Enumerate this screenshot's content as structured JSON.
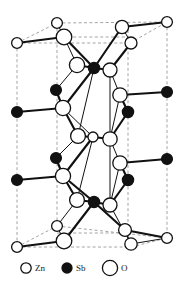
{
  "figure": {
    "kind": "crystal-structure-unit-cell",
    "width": 184,
    "height": 288,
    "background": "#ffffff"
  },
  "legend": {
    "items": [
      {
        "symbol": "Zn",
        "marker": "small-open-circle",
        "radius": 5.2,
        "fill": "#ffffff",
        "stroke": "#111111",
        "cx": 26,
        "cy": 268
      },
      {
        "symbol": "Sb",
        "marker": "small-filled-circle",
        "radius": 5.0,
        "fill": "#111111",
        "stroke": "#111111",
        "cx": 67,
        "cy": 268
      },
      {
        "symbol": "O",
        "marker": "large-open-circle",
        "radius": 7.6,
        "fill": "#ffffff",
        "stroke": "#111111",
        "cx": 110,
        "cy": 268
      }
    ],
    "label_positions": [
      {
        "text": "Zn",
        "x": 35,
        "y": 271
      },
      {
        "text": "Sb",
        "x": 76,
        "y": 271
      },
      {
        "text": "O",
        "x": 121,
        "y": 271
      }
    ]
  },
  "style": {
    "bond_color": "#111111",
    "bond_width": 2.1,
    "thin_bond_width": 1.0,
    "cell_edge_color": "#9a9a9a",
    "cell_edge_width": 0.9,
    "cell_dash": "3,2.4",
    "atom_stroke": "#111111",
    "atom_stroke_width": 1.3,
    "open_fill": "#ffffff",
    "filled_fill": "#111111"
  },
  "unit_cell": {
    "note": "dashed grey parallelepiped outline",
    "lines": [
      {
        "name": "left-front-vertical",
        "x1": 17,
        "y1": 43,
        "x2": 17,
        "y2": 247
      },
      {
        "name": "mid-left-vertical",
        "x1": 57,
        "y1": 23,
        "x2": 57,
        "y2": 226
      },
      {
        "name": "mid-right-vertical",
        "x1": 128,
        "y1": 30,
        "x2": 128,
        "y2": 243
      },
      {
        "name": "right-back-vertical",
        "x1": 167,
        "y1": 22,
        "x2": 167,
        "y2": 238
      },
      {
        "name": "top-front-horizontal",
        "x1": 17,
        "y1": 43,
        "x2": 130,
        "y2": 43
      },
      {
        "name": "top-back-horizontal",
        "x1": 57,
        "y1": 23,
        "x2": 167,
        "y2": 22
      },
      {
        "name": "bot-front-horizontal",
        "x1": 17,
        "y1": 247,
        "x2": 131,
        "y2": 247
      },
      {
        "name": "bot-back-horizontal",
        "x1": 57,
        "y1": 226,
        "x2": 167,
        "y2": 238
      },
      {
        "name": "top-left-diagonal",
        "x1": 17,
        "y1": 43,
        "x2": 57,
        "y2": 23
      },
      {
        "name": "top-right-diagonal",
        "x1": 130,
        "y1": 43,
        "x2": 167,
        "y2": 22
      },
      {
        "name": "bot-left-diagonal",
        "x1": 17,
        "y1": 247,
        "x2": 57,
        "y2": 226
      },
      {
        "name": "bot-right-diagonal",
        "x1": 131,
        "y1": 247,
        "x2": 167,
        "y2": 238
      },
      {
        "name": "top-inner-horizontal",
        "x1": 57,
        "y1": 37,
        "x2": 128,
        "y2": 37
      },
      {
        "name": "bot-inner-horizontal",
        "x1": 57,
        "y1": 233,
        "x2": 128,
        "y2": 233
      }
    ]
  },
  "atoms": [
    {
      "id": "a01",
      "element": "Zn",
      "cx": 57,
      "cy": 23,
      "r": 5.4,
      "type": "open"
    },
    {
      "id": "a02",
      "element": "O",
      "cx": 64,
      "cy": 37,
      "r": 7.8,
      "type": "open"
    },
    {
      "id": "a03",
      "element": "Zn",
      "cx": 17,
      "cy": 43,
      "r": 5.4,
      "type": "open"
    },
    {
      "id": "a04",
      "element": "Zn",
      "cx": 122,
      "cy": 27,
      "r": 6.6,
      "type": "open"
    },
    {
      "id": "a05",
      "element": "Zn",
      "cx": 167,
      "cy": 22,
      "r": 5.4,
      "type": "open"
    },
    {
      "id": "a06",
      "element": "O",
      "cx": 131,
      "cy": 43,
      "r": 6.0,
      "type": "open"
    },
    {
      "id": "a07",
      "element": "O",
      "cx": 77,
      "cy": 65,
      "r": 7.6,
      "type": "open"
    },
    {
      "id": "a08",
      "element": "Sb",
      "cx": 94,
      "cy": 68,
      "r": 5.6,
      "type": "filled"
    },
    {
      "id": "a09",
      "element": "O",
      "cx": 110,
      "cy": 70,
      "r": 7.0,
      "type": "open"
    },
    {
      "id": "a10",
      "element": "Sb",
      "cx": 56,
      "cy": 90,
      "r": 5.4,
      "type": "filled"
    },
    {
      "id": "a11",
      "element": "O",
      "cx": 120,
      "cy": 95,
      "r": 7.2,
      "type": "open"
    },
    {
      "id": "a12",
      "element": "Sb",
      "cx": 167,
      "cy": 92,
      "r": 5.4,
      "type": "filled"
    },
    {
      "id": "a13",
      "element": "O",
      "cx": 63,
      "cy": 108,
      "r": 7.6,
      "type": "open"
    },
    {
      "id": "a14",
      "element": "Sb",
      "cx": 17,
      "cy": 112,
      "r": 5.4,
      "type": "filled"
    },
    {
      "id": "a15",
      "element": "Sb",
      "cx": 128,
      "cy": 112,
      "r": 5.6,
      "type": "filled"
    },
    {
      "id": "a16",
      "element": "O",
      "cx": 78,
      "cy": 136,
      "r": 7.4,
      "type": "open"
    },
    {
      "id": "a17",
      "element": "Zn",
      "cx": 93,
      "cy": 137,
      "r": 5.0,
      "type": "open"
    },
    {
      "id": "a18",
      "element": "O",
      "cx": 110,
      "cy": 139,
      "r": 7.2,
      "type": "open"
    },
    {
      "id": "a19",
      "element": "Sb",
      "cx": 56,
      "cy": 158,
      "r": 5.4,
      "type": "filled"
    },
    {
      "id": "a20",
      "element": "O",
      "cx": 120,
      "cy": 163,
      "r": 7.2,
      "type": "open"
    },
    {
      "id": "a21",
      "element": "Sb",
      "cx": 167,
      "cy": 159,
      "r": 5.4,
      "type": "filled"
    },
    {
      "id": "a22",
      "element": "O",
      "cx": 63,
      "cy": 176,
      "r": 7.6,
      "type": "open"
    },
    {
      "id": "a23",
      "element": "Sb",
      "cx": 17,
      "cy": 180,
      "r": 5.4,
      "type": "filled"
    },
    {
      "id": "a24",
      "element": "Sb",
      "cx": 128,
      "cy": 180,
      "r": 5.6,
      "type": "filled"
    },
    {
      "id": "a25",
      "element": "O",
      "cx": 77,
      "cy": 200,
      "r": 7.4,
      "type": "open"
    },
    {
      "id": "a26",
      "element": "Sb",
      "cx": 94,
      "cy": 202,
      "r": 5.6,
      "type": "filled"
    },
    {
      "id": "a27",
      "element": "O",
      "cx": 110,
      "cy": 205,
      "r": 7.0,
      "type": "open"
    },
    {
      "id": "a28",
      "element": "Zn",
      "cx": 57,
      "cy": 226,
      "r": 5.4,
      "type": "open"
    },
    {
      "id": "a29",
      "element": "Zn",
      "cx": 125,
      "cy": 230,
      "r": 6.4,
      "type": "open"
    },
    {
      "id": "a30",
      "element": "O",
      "cx": 64,
      "cy": 241,
      "r": 7.8,
      "type": "open"
    },
    {
      "id": "a31",
      "element": "O",
      "cx": 131,
      "cy": 244,
      "r": 6.2,
      "type": "open"
    },
    {
      "id": "a32",
      "element": "Zn",
      "cx": 17,
      "cy": 247,
      "r": 5.4,
      "type": "open"
    },
    {
      "id": "a33",
      "element": "Zn",
      "cx": 167,
      "cy": 238,
      "r": 5.4,
      "type": "open"
    }
  ],
  "bonds": [
    {
      "from": "a03",
      "to": "a02",
      "weight": "thick"
    },
    {
      "from": "a01",
      "to": "a02",
      "weight": "thin"
    },
    {
      "from": "a02",
      "to": "a08",
      "weight": "thick"
    },
    {
      "from": "a02",
      "to": "a07",
      "weight": "thin"
    },
    {
      "from": "a04",
      "to": "a05",
      "weight": "thick"
    },
    {
      "from": "a04",
      "to": "a08",
      "weight": "thick"
    },
    {
      "from": "a04",
      "to": "a06",
      "weight": "thin"
    },
    {
      "from": "a06",
      "to": "a09",
      "weight": "thick"
    },
    {
      "from": "a07",
      "to": "a08",
      "weight": "thick"
    },
    {
      "from": "a08",
      "to": "a09",
      "weight": "thick"
    },
    {
      "from": "a07",
      "to": "a10",
      "weight": "thin"
    },
    {
      "from": "a08",
      "to": "a13",
      "weight": "thick"
    },
    {
      "from": "a09",
      "to": "a11",
      "weight": "thin"
    },
    {
      "from": "a08",
      "to": "a16",
      "weight": "thin"
    },
    {
      "from": "a09",
      "to": "a18",
      "weight": "thin"
    },
    {
      "from": "a10",
      "to": "a13",
      "weight": "thick"
    },
    {
      "from": "a14",
      "to": "a13",
      "weight": "thick"
    },
    {
      "from": "a11",
      "to": "a15",
      "weight": "thick"
    },
    {
      "from": "a12",
      "to": "a11",
      "weight": "thick"
    },
    {
      "from": "a13",
      "to": "a16",
      "weight": "thick"
    },
    {
      "from": "a13",
      "to": "a17",
      "weight": "thin"
    },
    {
      "from": "a15",
      "to": "a18",
      "weight": "thick"
    },
    {
      "from": "a11",
      "to": "a18",
      "weight": "thin"
    },
    {
      "from": "a16",
      "to": "a17",
      "weight": "thick"
    },
    {
      "from": "a17",
      "to": "a18",
      "weight": "thick"
    },
    {
      "from": "a16",
      "to": "a19",
      "weight": "thin"
    },
    {
      "from": "a17",
      "to": "a22",
      "weight": "thick"
    },
    {
      "from": "a18",
      "to": "a20",
      "weight": "thin"
    },
    {
      "from": "a17",
      "to": "a25",
      "weight": "thin"
    },
    {
      "from": "a18",
      "to": "a27",
      "weight": "thin"
    },
    {
      "from": "a19",
      "to": "a22",
      "weight": "thick"
    },
    {
      "from": "a23",
      "to": "a22",
      "weight": "thick"
    },
    {
      "from": "a20",
      "to": "a24",
      "weight": "thick"
    },
    {
      "from": "a21",
      "to": "a20",
      "weight": "thick"
    },
    {
      "from": "a22",
      "to": "a25",
      "weight": "thick"
    },
    {
      "from": "a22",
      "to": "a26",
      "weight": "thick"
    },
    {
      "from": "a24",
      "to": "a27",
      "weight": "thick"
    },
    {
      "from": "a20",
      "to": "a27",
      "weight": "thin"
    },
    {
      "from": "a25",
      "to": "a26",
      "weight": "thick"
    },
    {
      "from": "a26",
      "to": "a27",
      "weight": "thick"
    },
    {
      "from": "a26",
      "to": "a30",
      "weight": "thick"
    },
    {
      "from": "a25",
      "to": "a28",
      "weight": "thin"
    },
    {
      "from": "a26",
      "to": "a29",
      "weight": "thick"
    },
    {
      "from": "a27",
      "to": "a31",
      "weight": "thin"
    },
    {
      "from": "a28",
      "to": "a30",
      "weight": "thin"
    },
    {
      "from": "a32",
      "to": "a30",
      "weight": "thick"
    },
    {
      "from": "a29",
      "to": "a31",
      "weight": "thin"
    },
    {
      "from": "a29",
      "to": "a33",
      "weight": "thick"
    },
    {
      "from": "a31",
      "to": "a33",
      "weight": "thin"
    }
  ]
}
